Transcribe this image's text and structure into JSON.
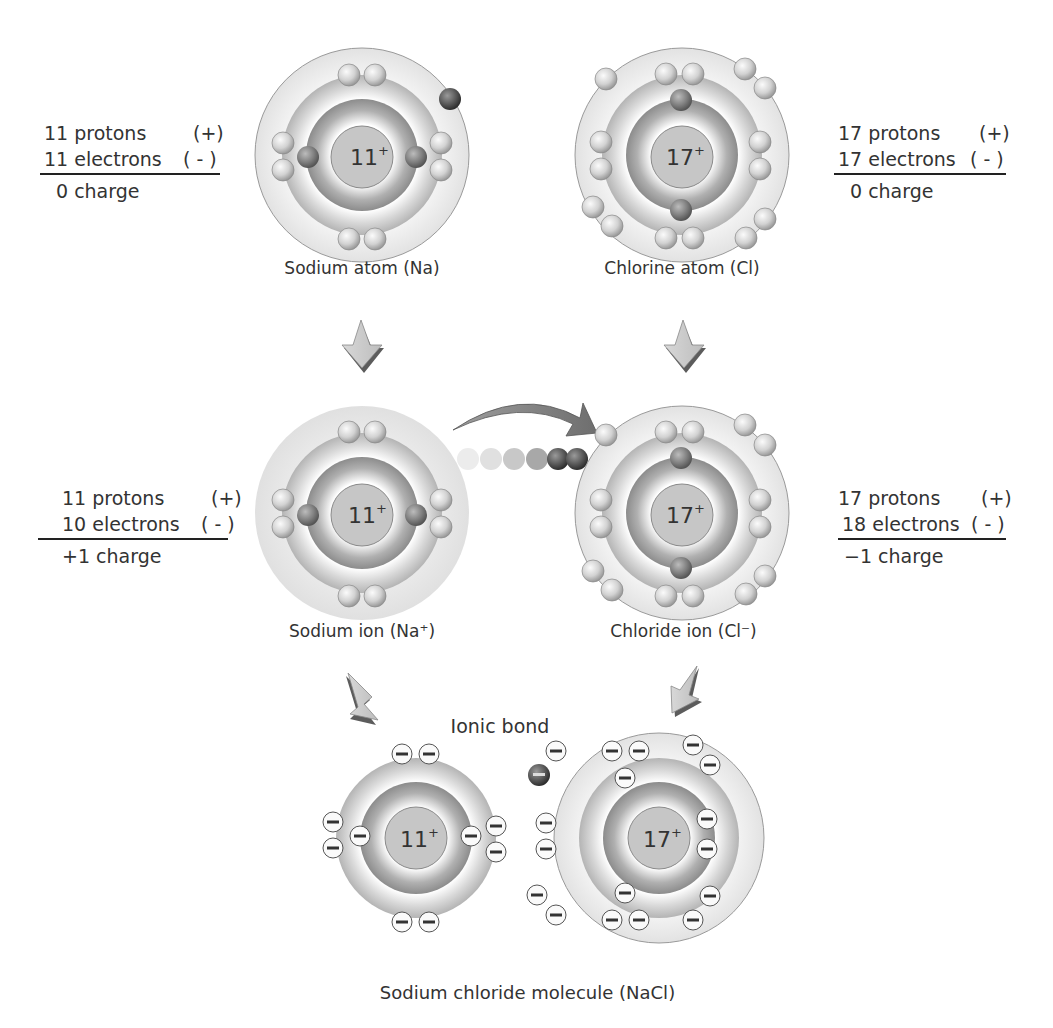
{
  "atoms": {
    "sodium_atom": {
      "label": "Sodium atom (Na)",
      "nucleus": "11",
      "nucleus_sup": "+",
      "calc": {
        "protons": "11 protons",
        "protons_sign": "(+)",
        "electrons": "11 electrons",
        "electrons_sign": "( - )",
        "charge": "0 charge"
      }
    },
    "chlorine_atom": {
      "label": "Chlorine atom (Cl)",
      "nucleus": "17",
      "nucleus_sup": "+",
      "calc": {
        "protons": "17 protons",
        "protons_sign": "(+)",
        "electrons": "17 electrons",
        "electrons_sign": "( - )",
        "charge": "0 charge"
      }
    },
    "sodium_ion": {
      "label": "Sodium ion (Na⁺)",
      "nucleus": "11",
      "nucleus_sup": "+",
      "calc": {
        "protons": "11 protons",
        "protons_sign": "(+)",
        "electrons": "10 electrons",
        "electrons_sign": "( - )",
        "charge": "+1 charge"
      }
    },
    "chloride_ion": {
      "label": "Chloride ion (Cl⁻)",
      "nucleus": "17",
      "nucleus_sup": "+",
      "calc": {
        "protons": "17 protons",
        "protons_sign": "(+)",
        "electrons": "18 electrons",
        "electrons_sign": "( - )",
        "charge": "−1  charge"
      }
    }
  },
  "molecule": {
    "bond_label": "Ionic bond",
    "title": "Sodium chloride molecule (NaCl)",
    "na_nucleus": "11",
    "cl_nucleus": "17",
    "sup": "+",
    "electron_symbol": "−"
  },
  "colors": {
    "outer_shell": "#f0f0f0",
    "middle_shell": "#c8c8c8",
    "inner_shell": "#9a9a9a",
    "nucleus": "#c4c4c4",
    "electron": "#d6d6d6",
    "valence_electron": "#555555",
    "arrow": "#c8c8c8",
    "arrow_shadow": "#5a5a5a"
  }
}
